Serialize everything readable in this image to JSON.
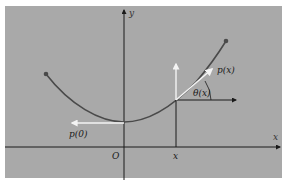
{
  "figure": {
    "background": "#ffffff",
    "panel_color": "#a9a9a9",
    "curve_color": "#4a4a4a",
    "axis_color": "#1a1a1a",
    "vector_color": "#f4f4f4",
    "labels": {
      "y_axis": "y",
      "x_axis": "x",
      "origin": "O",
      "x_point": "x",
      "p0": "p(0)",
      "px": "p(x)",
      "theta": "θ(x)"
    }
  }
}
